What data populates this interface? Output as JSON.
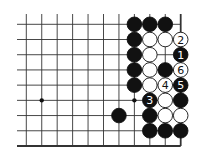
{
  "diagram": {
    "type": "go-board-fragment",
    "columns": 11,
    "rows": 9,
    "origin_x": 26.3,
    "origin_y": 24.3,
    "spacing_x": 15.44,
    "spacing_y": 15.21,
    "left_open_extent": 17,
    "top_open_extent": 14,
    "edges": {
      "right": true,
      "bottom": true,
      "left": false,
      "top": false
    },
    "star_points": [
      {
        "col": 1,
        "row": 5
      },
      {
        "col": 7,
        "row": 5
      }
    ],
    "colors": {
      "black": "#111111",
      "white": "#ffffff",
      "line": "#333333"
    },
    "stones": [
      {
        "col": 7,
        "row": 0,
        "color": "black"
      },
      {
        "col": 8,
        "row": 0,
        "color": "black"
      },
      {
        "col": 9,
        "row": 0,
        "color": "black"
      },
      {
        "col": 7,
        "row": 1,
        "color": "black"
      },
      {
        "col": 8,
        "row": 1,
        "color": "white"
      },
      {
        "col": 9,
        "row": 1,
        "color": "white"
      },
      {
        "col": 10,
        "row": 1,
        "color": "white",
        "label": "2"
      },
      {
        "col": 7,
        "row": 2,
        "color": "black"
      },
      {
        "col": 8,
        "row": 2,
        "color": "white"
      },
      {
        "col": 10,
        "row": 2,
        "color": "black",
        "label": "1"
      },
      {
        "col": 7,
        "row": 3,
        "color": "black"
      },
      {
        "col": 8,
        "row": 3,
        "color": "white"
      },
      {
        "col": 9,
        "row": 3,
        "color": "black"
      },
      {
        "col": 10,
        "row": 3,
        "color": "white",
        "label": "6"
      },
      {
        "col": 7,
        "row": 4,
        "color": "black"
      },
      {
        "col": 8,
        "row": 4,
        "color": "white"
      },
      {
        "col": 9,
        "row": 4,
        "color": "white",
        "label": "4"
      },
      {
        "col": 10,
        "row": 4,
        "color": "black",
        "label": "5"
      },
      {
        "col": 8,
        "row": 5,
        "color": "black",
        "label": "3"
      },
      {
        "col": 9,
        "row": 5,
        "color": "white"
      },
      {
        "col": 10,
        "row": 5,
        "color": "black"
      },
      {
        "col": 6,
        "row": 6,
        "color": "black"
      },
      {
        "col": 8,
        "row": 6,
        "color": "black"
      },
      {
        "col": 9,
        "row": 6,
        "color": "white"
      },
      {
        "col": 10,
        "row": 6,
        "color": "white"
      },
      {
        "col": 8,
        "row": 7,
        "color": "black"
      },
      {
        "col": 9,
        "row": 7,
        "color": "black"
      },
      {
        "col": 10,
        "row": 7,
        "color": "black"
      }
    ]
  }
}
